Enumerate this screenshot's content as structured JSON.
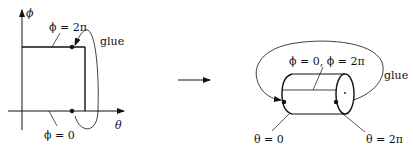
{
  "left_panel": {
    "axis_y_label": "ϕ",
    "axis_x_label": "θ",
    "top_edge_label": "ϕ = 2π",
    "bottom_edge_label": "ϕ = 0",
    "glue_label": "glue"
  },
  "transition_arrow": {
    "direction": "right"
  },
  "right_panel": {
    "seam_label": "ϕ = 0, ϕ = 2π",
    "left_end_label": "θ = 0",
    "right_end_label": "θ = 2π",
    "glue_label": "glue"
  },
  "colors": {
    "stroke": "#111111",
    "background": "#ffffff"
  }
}
